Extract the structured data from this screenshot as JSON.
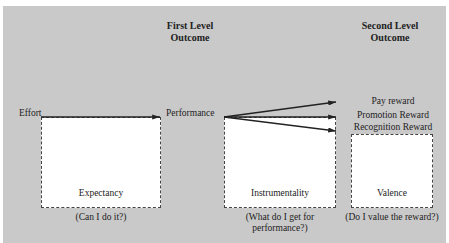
{
  "headers": {
    "first_level": [
      "First Level",
      "Outcome"
    ],
    "second_level": [
      "Second Level",
      "Outcome"
    ]
  },
  "nodes": {
    "effort": "Effort",
    "performance": "Performance"
  },
  "rewards": [
    "Pay reward",
    "Promotion Reward",
    "Recognition Reward"
  ],
  "boxes": [
    {
      "label": "Expectancy",
      "question": "(Can I do it?)"
    },
    {
      "label": "Instrumentality",
      "question_line1": "(What do I get for",
      "question_line2": "performance?)"
    },
    {
      "label": "Valence",
      "question": "(Do I value the reward?)"
    }
  ],
  "colors": {
    "background": "#c9c9c9",
    "box_fill": "#ffffff",
    "line": "#222222"
  }
}
